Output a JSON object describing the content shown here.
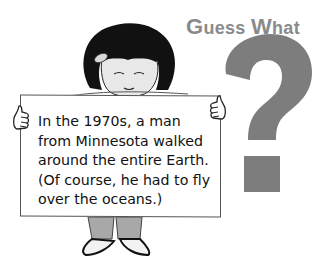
{
  "heading": {
    "first_letter": "G",
    "rest_word1": "uess",
    "space": " ",
    "second_letter": "W",
    "rest_word2": "hat",
    "full": "Guess What",
    "color": "#8a8a8a"
  },
  "decoration": {
    "question_mark_icon": "question-mark",
    "question_mark_color": "#7d7d7d"
  },
  "sign": {
    "lines": [
      "In the 1970s, a man",
      "from Minnesota walked",
      "around the entire Earth.",
      "(Of course, he had to fly",
      "over the oceans.)"
    ]
  }
}
